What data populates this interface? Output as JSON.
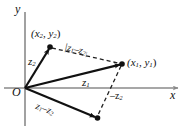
{
  "figure": {
    "kind": "vector-diagram",
    "axes": {
      "x_label": "x",
      "y_label": "y",
      "origin_label": "O",
      "axis_color": "#8a8a8a"
    },
    "colors": {
      "stroke": "#111111",
      "axis": "#8a8a8a",
      "dash": "#222222",
      "background": "#ffffff"
    },
    "points": [
      {
        "id": "p2",
        "label_main": "(x",
        "label_sub1": "2",
        "label_mid": ", y",
        "label_sub2": "2",
        "label_end": ")",
        "x": 50,
        "y": 47
      },
      {
        "id": "p1",
        "label_main": "(x",
        "label_sub1": "1",
        "label_mid": ", y",
        "label_sub2": "1",
        "label_end": ")",
        "x": 122,
        "y": 64
      },
      {
        "id": "pd",
        "x": 97,
        "y": 118
      }
    ],
    "vectors": [
      {
        "id": "z2",
        "base": "z",
        "sub": "2",
        "from": [
          25,
          88
        ],
        "to": [
          50,
          47
        ],
        "style": "solid"
      },
      {
        "id": "z1",
        "base": "z",
        "sub": "1",
        "from": [
          25,
          88
        ],
        "to": [
          122,
          64
        ],
        "style": "solid"
      },
      {
        "id": "z1mz2",
        "base": "z",
        "sub": "1",
        "op": " − ",
        "base2": "z",
        "sub2": "2",
        "from": [
          25,
          88
        ],
        "to": [
          97,
          118
        ],
        "style": "solid"
      },
      {
        "id": "negz2",
        "base": "−z",
        "sub": "2",
        "from": [
          122,
          64
        ],
        "to": [
          97,
          118
        ],
        "style": "dashed"
      },
      {
        "id": "modz1z2",
        "base": "|z",
        "sub": "1",
        "op": " − ",
        "base2": "z",
        "sub2": "2|",
        "from": [
          50,
          47
        ],
        "to": [
          122,
          64
        ],
        "style": "dashed"
      }
    ],
    "labels": {
      "y_axis": "y",
      "x_axis": "x",
      "origin": "O",
      "z2": "z",
      "z2_sub": "2",
      "z1": "z",
      "z1_sub": "1",
      "diff_a": "z",
      "diff_a_sub": "1",
      "diff_op": "–",
      "diff_b": "z",
      "diff_b_sub": "2",
      "neg_z2": "–z",
      "neg_z2_sub": "2",
      "mod_open": "|z",
      "mod_a_sub": "1",
      "mod_op": "–",
      "mod_b": "z",
      "mod_b_sub": "2|",
      "pt2_open": "(x",
      "pt2_sub1": "2",
      "pt2_mid": ", y",
      "pt2_sub2": "2",
      "pt2_close": ")",
      "pt1_open": "(x",
      "pt1_sub1": "1",
      "pt1_mid": ", y",
      "pt1_sub2": "1",
      "pt1_close": ")"
    }
  }
}
